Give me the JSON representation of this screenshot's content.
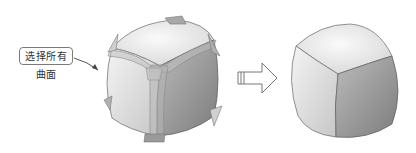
{
  "diagram": {
    "callout_label": "选择所有曲面",
    "before": "cube-with-edge-surfaces",
    "after": "rounded-cube",
    "transition": "arrow-right-icon"
  },
  "colors": {
    "shape_light": "#f2f2f2",
    "shape_mid": "#c8c8c8",
    "shape_dark": "#8a8a8a",
    "outline": "#6a6a6a"
  }
}
